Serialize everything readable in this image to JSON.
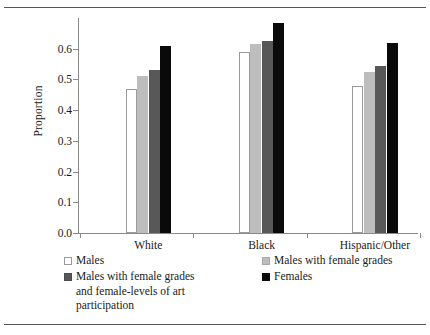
{
  "chart_data": {
    "type": "bar",
    "title": "",
    "xlabel": "",
    "ylabel": "Proportion",
    "ylim": [
      0.0,
      0.7
    ],
    "ytick_labels": [
      "0.0",
      "0.1",
      "0.2",
      "0.3",
      "0.4",
      "0.5",
      "0.6"
    ],
    "ytick_values": [
      0.0,
      0.1,
      0.2,
      0.3,
      0.4,
      0.5,
      0.6
    ],
    "grid": false,
    "legend_position": "below",
    "categories": [
      "White",
      "Black",
      "Hispanic/Other"
    ],
    "series": [
      {
        "name": "Males",
        "color": "#ffffff",
        "values": [
          0.47,
          0.59,
          0.48
        ]
      },
      {
        "name": "Males with female grades",
        "color": "#bdbdbd",
        "values": [
          0.51,
          0.615,
          0.525
        ]
      },
      {
        "name": "Males with female grades and female-levels of art participation",
        "color": "#585858",
        "values": [
          0.53,
          0.625,
          0.545
        ]
      },
      {
        "name": "Females",
        "color": "#0a0a0a",
        "values": [
          0.61,
          0.685,
          0.62
        ]
      }
    ]
  },
  "legend": {
    "items": [
      {
        "label": "Males",
        "label_line2": "",
        "label_line3": "",
        "swatch": "males-swatch"
      },
      {
        "label": "Males with female grades",
        "label_line2": "",
        "label_line3": "",
        "swatch": "grades-swatch"
      },
      {
        "label": "Males with female grades",
        "label_line2": "and female-levels of art",
        "label_line3": "participation",
        "swatch": "grades-art-swatch"
      },
      {
        "label": "Females",
        "label_line2": "",
        "label_line3": "",
        "swatch": "females-swatch"
      }
    ]
  }
}
